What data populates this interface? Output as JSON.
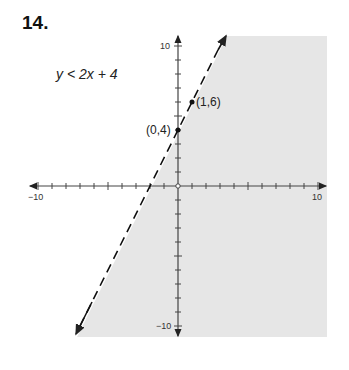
{
  "problem": {
    "number": "14.",
    "inequality": "y < 2x + 4"
  },
  "chart_data": {
    "type": "line",
    "title": "y < 2x + 4",
    "xlabel": "",
    "ylabel": "",
    "xlim": [
      -10,
      10
    ],
    "ylim": [
      -10,
      10
    ],
    "grid": false,
    "tick_step": 1,
    "tick_labels": {
      "x": [
        "-10",
        "10"
      ],
      "y": [
        "10",
        "-10"
      ]
    },
    "boundary": {
      "equation": "y = 2x + 4",
      "slope": 2,
      "intercept": 4,
      "style": "dashed",
      "arrows": "both"
    },
    "shaded_region": "below/right of line (y < 2x + 4)",
    "points": [
      {
        "label": "(0,4)",
        "x": 0,
        "y": 4
      },
      {
        "label": "(1,6)",
        "x": 1,
        "y": 6
      }
    ],
    "colors": {
      "shade": "#e6e6e6",
      "line": "#111111",
      "axis": "#444444"
    }
  },
  "labels": {
    "x_min": "−10",
    "x_max": "10",
    "y_max": "10",
    "y_min": "−10",
    "p1": "(0,4)",
    "p2": "(1,6)"
  }
}
